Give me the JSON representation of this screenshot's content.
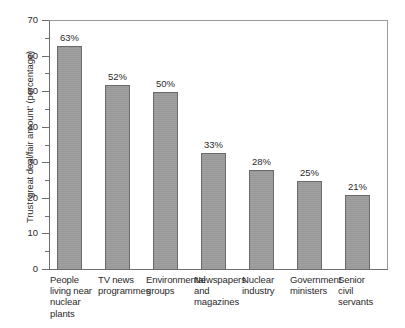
{
  "chart_data": {
    "type": "bar",
    "title": "",
    "xlabel": "",
    "ylabel": "Trust 'great deal/fair amount' (percentage)",
    "ylim": [
      0,
      70
    ],
    "y_ticks": [
      0,
      10,
      20,
      30,
      40,
      50,
      60,
      70
    ],
    "y_minor_ticks": [
      5,
      15,
      25,
      35,
      45,
      55,
      65
    ],
    "grid": false,
    "legend": "none",
    "bar_color": "#9d9d9d",
    "bar_edge_color": "#6a6a6a",
    "axis_color": "#6e6e6e",
    "categories": [
      "People living near nuclear plants",
      "TV news programmes",
      "Environmental groups",
      "Newspapers and magazines",
      "Nuclear industry",
      "Government ministers",
      "Senior civil servants"
    ],
    "category_label_lines": [
      [
        "People",
        "living near",
        "nuclear",
        "plants"
      ],
      [
        "TV news",
        "programmes"
      ],
      [
        "Environmental",
        "groups"
      ],
      [
        "Newspapers",
        "and",
        "magazines"
      ],
      [
        "Nuclear",
        "industry"
      ],
      [
        "Government",
        "ministers"
      ],
      [
        "Senior",
        "civil",
        "servants"
      ]
    ],
    "values": [
      63,
      52,
      50,
      33,
      28,
      25,
      21
    ],
    "value_labels": [
      "63%",
      "52%",
      "50%",
      "33%",
      "28%",
      "25%",
      "21%"
    ],
    "tick_labels": [
      "0",
      "10",
      "20",
      "30",
      "40",
      "50",
      "60",
      "70"
    ]
  }
}
